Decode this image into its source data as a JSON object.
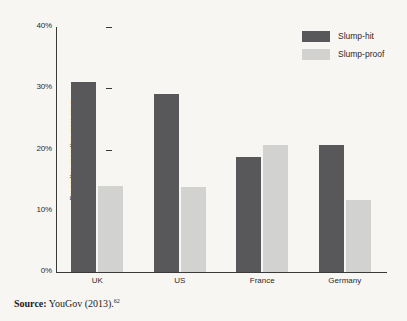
{
  "chart_data": {
    "type": "bar",
    "title": "",
    "subtitle": "",
    "xlabel": "",
    "ylabel": "Proportion reporting more rows",
    "categories": [
      "UK",
      "US",
      "France",
      "Germany"
    ],
    "series": [
      {
        "name": "Slump-hit",
        "color": "#58585a",
        "values": [
          31.0,
          29.0,
          18.8,
          20.7
        ]
      },
      {
        "name": "Slump-proof",
        "color": "#d2d2d0",
        "values": [
          14.0,
          13.9,
          20.7,
          11.8
        ]
      }
    ],
    "ylim": [
      0,
      40
    ],
    "yticks": [
      0,
      10,
      20,
      30,
      40
    ],
    "ytick_labels": [
      "0%",
      "10%",
      "20%",
      "30%",
      "40%"
    ],
    "grid": false,
    "legend_position": "top-right",
    "value_format": "percent"
  },
  "legend": {
    "items": [
      {
        "label": "Slump-hit",
        "swatch": "dark"
      },
      {
        "label": "Slump-proof",
        "swatch": "light"
      }
    ]
  },
  "source": {
    "prefix": "Source:",
    "text": "YouGov (2013).",
    "footnote": "62"
  }
}
